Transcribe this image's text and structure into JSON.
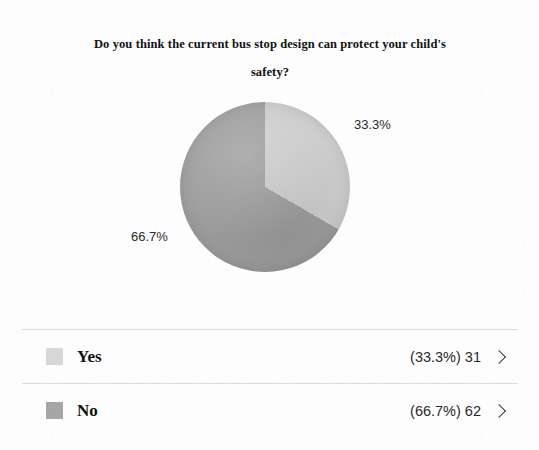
{
  "chart_data": {
    "type": "pie",
    "title": "Do you think the current bus stop design can protect your child's safety?",
    "categories": [
      "Yes",
      "No"
    ],
    "values": [
      31,
      62
    ],
    "percentages": [
      "33.3%",
      "66.7%"
    ],
    "slice_labels": [
      "33.3%",
      "66.7%"
    ],
    "colors": [
      "#cdcdcd",
      "#9d9d9d"
    ],
    "total": 93,
    "legend_position": "bottom",
    "grid": false,
    "start_angle_deg": 0,
    "direction": "clockwise"
  },
  "title": {
    "line1": "Do you think the current bus stop design can protect your child's",
    "line2": "safety?"
  },
  "pie_labels": {
    "yes_pct": "33.3%",
    "no_pct": "66.7%"
  },
  "legend": {
    "rows": [
      {
        "label": "Yes",
        "value": "(33.3%) 31",
        "swatch_color": "#d7d7d7",
        "chevron": "chevron-right-icon"
      },
      {
        "label": "No",
        "value": "(66.7%) 62",
        "swatch_color": "#a6a6a6",
        "chevron": "chevron-right-icon"
      }
    ]
  }
}
